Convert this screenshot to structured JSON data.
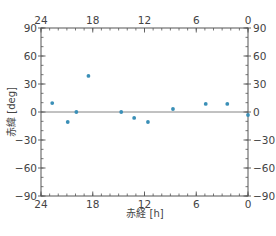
{
  "chart_data": {
    "type": "scatter",
    "title": "",
    "xlabel": "赤経 [h]",
    "ylabel": "赤緯 [deg]",
    "xlim": [
      24,
      0
    ],
    "ylim": [
      -90,
      90
    ],
    "x_ticks": [
      24,
      18,
      12,
      6,
      0
    ],
    "y_ticks": [
      90,
      60,
      30,
      0,
      -30,
      -60,
      -90
    ],
    "x_minor_step": 1,
    "y_minor_step": 10,
    "x_axis_inverted": true,
    "mirrored_axes": true,
    "zero_line": true,
    "grid": false,
    "legend": null,
    "marker_color": "#3a8fb7",
    "frame_color": "#555555",
    "points": [
      {
        "x": 22.7,
        "y": 9.6
      },
      {
        "x": 20.9,
        "y": -10.7
      },
      {
        "x": 19.9,
        "y": 0.0
      },
      {
        "x": 18.5,
        "y": 38.6
      },
      {
        "x": 14.7,
        "y": 0.0
      },
      {
        "x": 13.2,
        "y": -6.4
      },
      {
        "x": 11.6,
        "y": -10.7
      },
      {
        "x": 8.7,
        "y": 3.2
      },
      {
        "x": 4.9,
        "y": 8.6
      },
      {
        "x": 2.4,
        "y": 8.6
      },
      {
        "x": 0.0,
        "y": -3.2
      }
    ]
  }
}
